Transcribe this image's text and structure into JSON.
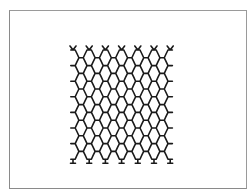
{
  "figure": {
    "frame_color": "#8f8f8f",
    "mesh_color": "#1a1a1a",
    "mesh": {
      "left": 73,
      "top": 50,
      "cell_width": 16.2,
      "row_pitch": 7.8,
      "columns": 7,
      "rows": 14,
      "stroke_width": 1.6
    }
  }
}
